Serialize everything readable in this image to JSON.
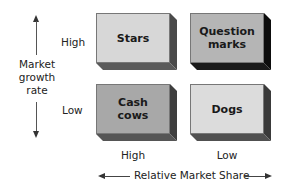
{
  "diagram": {
    "type": "BCG growth-share matrix",
    "y_axis": {
      "label": "Market growth rate",
      "label_lines": [
        "Market",
        "growth",
        "rate"
      ],
      "high_label": "High",
      "low_label": "Low"
    },
    "x_axis": {
      "label": "Relative Market Share",
      "high_label": "High",
      "low_label": "Low"
    },
    "quadrants": [
      {
        "id": "stars",
        "label_lines": [
          "Stars"
        ],
        "row": "High growth",
        "col": "High share",
        "face_color": "#d7d7d7",
        "side_color": "#4a4a4a",
        "bottom_color": "#5a5a5a"
      },
      {
        "id": "question-marks",
        "label_lines": [
          "Question",
          "marks"
        ],
        "row": "High growth",
        "col": "Low share",
        "face_color": "#b5b5b5",
        "side_color": "#0d0d0d",
        "bottom_color": "#1a1a1a"
      },
      {
        "id": "cash-cows",
        "label_lines": [
          "Cash",
          "cows"
        ],
        "row": "Low growth",
        "col": "High share",
        "face_color": "#a8a8a8",
        "side_color": "#3e3e3e",
        "bottom_color": "#555555"
      },
      {
        "id": "dogs",
        "label_lines": [
          "Dogs"
        ],
        "row": "Low growth",
        "col": "Low share",
        "face_color": "#dcdcdc",
        "side_color": "#3a3a3a",
        "bottom_color": "#505050"
      }
    ]
  }
}
